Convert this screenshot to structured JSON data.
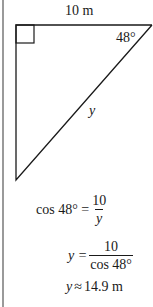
{
  "diagram": {
    "type": "right-triangle",
    "top_side_label": "10 m",
    "angle_label": "48°",
    "hypotenuse_label": "y",
    "right_angle_marker": true
  },
  "equations": [
    {
      "lhs": "cos 48° =",
      "frac_num": "10",
      "frac_den": "y"
    },
    {
      "lhs": "y =",
      "frac_num": "10",
      "frac_den": "cos 48°"
    },
    {
      "lhs": "y",
      "rel": "≈",
      "rhs": "14.9 m"
    }
  ],
  "colors": {
    "line": "#1a1a1a",
    "left_bar": "#9a9a9a"
  }
}
